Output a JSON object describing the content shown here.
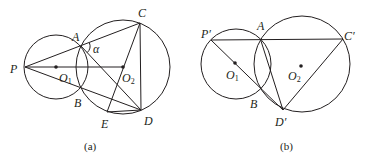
{
  "figures": [
    {
      "id": "a",
      "caption": "(a)",
      "circles": [
        {
          "name": "O1",
          "cx": 56,
          "cy": 67,
          "r": 32
        },
        {
          "name": "O2",
          "cx": 123,
          "cy": 67,
          "r": 47
        }
      ],
      "points": {
        "P": {
          "label": "P",
          "x": 25,
          "y": 67
        },
        "A": {
          "label": "A",
          "x": 81,
          "y": 46
        },
        "B": {
          "label": "B",
          "x": 81,
          "y": 88
        },
        "C": {
          "label": "C",
          "x": 140,
          "y": 23
        },
        "D": {
          "label": "D",
          "x": 141,
          "y": 110
        },
        "E": {
          "label": "E",
          "x": 107,
          "y": 112
        },
        "O1": {
          "label": "O",
          "sub": "1",
          "x": 56,
          "y": 67
        },
        "O2": {
          "label": "O",
          "sub": "2",
          "x": 123,
          "y": 67
        }
      },
      "angle_label": "α"
    },
    {
      "id": "b",
      "caption": "(b)",
      "circles": [
        {
          "name": "O1",
          "cx": 236,
          "cy": 64,
          "r": 35
        },
        {
          "name": "O2",
          "cx": 302,
          "cy": 64,
          "r": 48
        }
      ],
      "points": {
        "P": {
          "label": "P′",
          "x": 211,
          "y": 40
        },
        "A": {
          "label": "A",
          "x": 261,
          "y": 41
        },
        "B": {
          "label": "B",
          "x": 259,
          "y": 87
        },
        "C": {
          "label": "C′",
          "x": 343,
          "y": 39
        },
        "D": {
          "label": "D′",
          "x": 283,
          "y": 110
        },
        "O1": {
          "label": "O",
          "sub": "1",
          "x": 235,
          "y": 63
        },
        "O2": {
          "label": "O",
          "sub": "2",
          "x": 301,
          "y": 66
        }
      }
    }
  ]
}
